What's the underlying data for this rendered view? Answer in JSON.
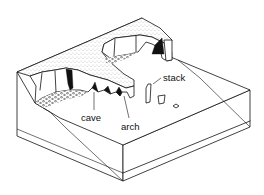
{
  "diagram": {
    "labels": {
      "cave": "cave",
      "arch": "arch",
      "stack": "stack"
    },
    "colors": {
      "ink": "#111111",
      "background": "#ffffff"
    }
  }
}
